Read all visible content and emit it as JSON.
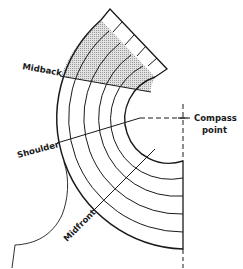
{
  "diagram": {
    "type": "pattern-radial-grid",
    "labels": {
      "midback": "Midback",
      "shoulder": "Shoulder",
      "midfront": "Midfront",
      "compass_line1": "Compass",
      "compass_line2": "point"
    },
    "center": [
      183,
      118
    ],
    "arc_radii": [
      43,
      60,
      78,
      96,
      114,
      131
    ],
    "colors": {
      "ink": "#1a1a1a",
      "shade": "#bdbdbd",
      "background": "#ffffff"
    }
  }
}
